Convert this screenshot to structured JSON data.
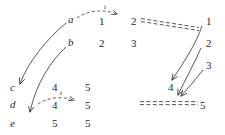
{
  "figure": {
    "type": "commutative-diagram",
    "background_color": "#ffffff",
    "stroke_color": "#3a3a3a",
    "text_color": "#1f1f1f"
  },
  "objects": {
    "a": "a",
    "b": "b",
    "c": "c",
    "d": "d",
    "e": "e"
  },
  "left_column_entries": [
    {
      "label": "a",
      "x": 68,
      "y": 20
    },
    {
      "label": "b",
      "x": 68,
      "y": 43
    },
    {
      "label": "c",
      "x": 10,
      "y": 88
    },
    {
      "label": "d",
      "x": 10,
      "y": 105
    },
    {
      "label": "e",
      "x": 10,
      "y": 124
    }
  ],
  "columns": [
    {
      "name": "col-1",
      "x": 99,
      "values": [
        {
          "value": "1",
          "y": 22
        },
        {
          "value": "2",
          "y": 44
        },
        {
          "value": "4",
          "y": 88
        },
        {
          "value": "4",
          "y": 106
        },
        {
          "value": "5",
          "y": 124
        }
      ]
    },
    {
      "name": "col-2",
      "x": 131,
      "values": [
        {
          "value": "2",
          "y": 22
        },
        {
          "value": "3",
          "y": 44
        },
        {
          "value": "5",
          "y": 88
        },
        {
          "value": "5",
          "y": 106
        },
        {
          "value": "5",
          "y": 124
        }
      ]
    },
    {
      "name": "col-3",
      "x": 206,
      "values": [
        {
          "value": "1",
          "y": 22
        },
        {
          "value": "2",
          "y": 44
        },
        {
          "value": "3",
          "y": 66
        },
        {
          "value": "4",
          "y": 88
        },
        {
          "value": "5",
          "y": 106
        }
      ]
    }
  ],
  "arrow_labels": [
    {
      "name": "t-label-top",
      "text": "t",
      "x": 115,
      "y": 5
    },
    {
      "name": "t-label-bottom",
      "text": "t",
      "x": 60,
      "y": 91
    }
  ],
  "equality_lines": [
    {
      "name": "equality-top",
      "from": "2",
      "to": "1",
      "style": "double-dashed"
    },
    {
      "name": "equality-bottom",
      "from": "5",
      "to": "5",
      "style": "double-dashed"
    }
  ],
  "mappings": [
    {
      "name": "map-a-to-c",
      "from": "a",
      "to": "c",
      "style": "curved-solid"
    },
    {
      "name": "map-b-to-e",
      "from": "b",
      "to": "e",
      "style": "curved-solid"
    },
    {
      "name": "map-1-to-4",
      "from": "1",
      "to": "4",
      "style": "curved-solid"
    },
    {
      "name": "map-2-to-5",
      "from": "2",
      "to": "5",
      "style": "curved-solid"
    },
    {
      "name": "map-3-to-5",
      "from": "3",
      "to": "5",
      "style": "curved-solid"
    },
    {
      "name": "transition-top",
      "from": "1",
      "to": "2",
      "style": "dashed",
      "label": "t"
    },
    {
      "name": "transition-bottom",
      "from": "4",
      "to": "5",
      "style": "dashed",
      "label": "t"
    }
  ]
}
